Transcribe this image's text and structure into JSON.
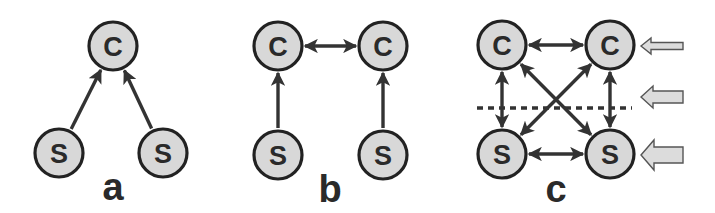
{
  "diagram": {
    "node_radius": 24,
    "colors": {
      "node_fill": "#d8d8d8",
      "node_stroke": "#222222",
      "edge": "#333333",
      "hollow_arrow_fill": "#dcdcdc",
      "text": "#2a2a2a"
    },
    "panels": [
      {
        "id": "a",
        "label": "a",
        "label_pos": [
          113,
          200
        ],
        "nodes": [
          {
            "id": "a-c",
            "label": "C",
            "x": 113,
            "y": 46
          },
          {
            "id": "a-s1",
            "label": "S",
            "x": 59,
            "y": 153
          },
          {
            "id": "a-s2",
            "label": "S",
            "x": 163,
            "y": 153
          }
        ],
        "edges": [
          {
            "from": "a-s1",
            "to": "a-c",
            "direction": "forward"
          },
          {
            "from": "a-s2",
            "to": "a-c",
            "direction": "forward"
          }
        ]
      },
      {
        "id": "b",
        "label": "b",
        "label_pos": [
          330,
          202
        ],
        "nodes": [
          {
            "id": "b-c1",
            "label": "C",
            "x": 278,
            "y": 46
          },
          {
            "id": "b-c2",
            "label": "C",
            "x": 383,
            "y": 46
          },
          {
            "id": "b-s1",
            "label": "S",
            "x": 278,
            "y": 155
          },
          {
            "id": "b-s2",
            "label": "S",
            "x": 383,
            "y": 155
          }
        ],
        "edges": [
          {
            "from": "b-c1",
            "to": "b-c2",
            "direction": "both"
          },
          {
            "from": "b-s1",
            "to": "b-c1",
            "direction": "forward"
          },
          {
            "from": "b-s2",
            "to": "b-c2",
            "direction": "forward"
          }
        ]
      },
      {
        "id": "c",
        "label": "c",
        "label_pos": [
          556,
          202
        ],
        "nodes": [
          {
            "id": "c-c1",
            "label": "C",
            "x": 502,
            "y": 45
          },
          {
            "id": "c-c2",
            "label": "C",
            "x": 610,
            "y": 45
          },
          {
            "id": "c-s1",
            "label": "S",
            "x": 502,
            "y": 154
          },
          {
            "id": "c-s2",
            "label": "S",
            "x": 610,
            "y": 154
          }
        ],
        "edges": [
          {
            "from": "c-c1",
            "to": "c-c2",
            "direction": "both"
          },
          {
            "from": "c-s1",
            "to": "c-s2",
            "direction": "both"
          },
          {
            "from": "c-c1",
            "to": "c-s1",
            "direction": "both"
          },
          {
            "from": "c-c2",
            "to": "c-s2",
            "direction": "both"
          },
          {
            "from": "c-c1",
            "to": "c-s2",
            "direction": "both"
          },
          {
            "from": "c-c2",
            "to": "c-s1",
            "direction": "both"
          }
        ],
        "divider": {
          "x1": 477,
          "x2": 632,
          "y": 108,
          "style": "dotted"
        },
        "side_arrows": [
          {
            "id": "arrow-top",
            "y": 46,
            "x_tip": 641,
            "x_tail": 683,
            "size": "small"
          },
          {
            "id": "arrow-middle",
            "y": 97,
            "x_tip": 641,
            "x_tail": 683,
            "size": "medium"
          },
          {
            "id": "arrow-bottom",
            "y": 155,
            "x_tip": 641,
            "x_tail": 683,
            "size": "large"
          }
        ]
      }
    ]
  }
}
